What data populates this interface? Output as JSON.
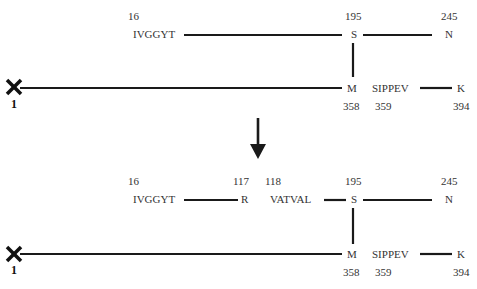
{
  "diagram": {
    "top": {
      "upper_chain": {
        "start_number": "16",
        "start_sequence": "IVGGYT",
        "junction_number": "195",
        "junction_residue": "S",
        "end_number": "245",
        "end_residue": "N"
      },
      "lower_chain": {
        "start_marker": "×",
        "start_number": "1",
        "junction_residue": "M",
        "junction_number": "358",
        "next_number": "359",
        "next_sequence": "SIPPEV",
        "end_residue": "K",
        "end_number": "394"
      }
    },
    "arrow": "down-arrow",
    "bottom": {
      "upper_chain": {
        "start_number": "16",
        "start_sequence": "IVGGYT",
        "cleave_number": "117",
        "cleave_residue": "R",
        "next_number": "118",
        "next_sequence": "VATVAL",
        "junction_number": "195",
        "junction_residue": "S",
        "end_number": "245",
        "end_residue": "N"
      },
      "lower_chain": {
        "start_marker": "×",
        "start_number": "1",
        "junction_residue": "M",
        "junction_number": "358",
        "next_number": "359",
        "next_sequence": "SIPPEV",
        "end_residue": "K",
        "end_number": "394"
      }
    }
  }
}
